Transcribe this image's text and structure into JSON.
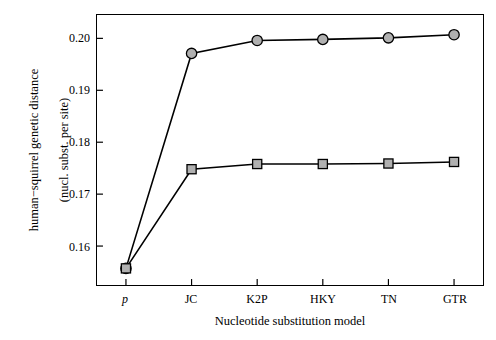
{
  "chart_data": {
    "type": "line",
    "title": "",
    "xlabel": "Nucleotide substitution model",
    "ylabel": "human−squirrel genetic distance\n(nucl. subst. per site)",
    "ylabel_line1": "human−squirrel genetic distance",
    "ylabel_line2": "(nucl. subst. per site)",
    "categories": [
      "p",
      "JC",
      "K2P",
      "HKY",
      "TN",
      "GTR"
    ],
    "xtick_italic": [
      true,
      false,
      false,
      false,
      false,
      false
    ],
    "ylim": [
      0.1525,
      0.2045
    ],
    "yticks": [
      0.16,
      0.17,
      0.18,
      0.19,
      0.2
    ],
    "ytick_labels": [
      "0.16",
      "0.17",
      "0.18",
      "0.19",
      "0.20"
    ],
    "grid": false,
    "legend": "none",
    "series": [
      {
        "name": "circle-series",
        "marker": "circle",
        "marker_fill": "#b0b0b0",
        "marker_edge": "#000000",
        "line_color": "#000000",
        "values": [
          0.1557,
          0.1971,
          0.1996,
          0.1998,
          0.2001,
          0.2007
        ]
      },
      {
        "name": "square-series",
        "marker": "square",
        "marker_fill": "#b0b0b0",
        "marker_edge": "#000000",
        "line_color": "#000000",
        "values": [
          0.1557,
          0.1748,
          0.1758,
          0.1758,
          0.1759,
          0.1762
        ]
      }
    ]
  }
}
